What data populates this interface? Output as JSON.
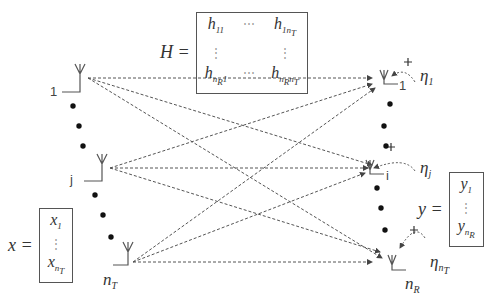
{
  "diagram": {
    "type": "MIMO channel model",
    "channel_matrix": {
      "lhs": "H =",
      "rows": [
        [
          "h11",
          "⋯",
          "h1nT"
        ],
        [
          "⋮",
          "",
          "⋮"
        ],
        [
          "hnR1",
          "⋯",
          "hnRnT"
        ]
      ]
    },
    "input_vector": {
      "lhs": "x =",
      "entries": [
        "x1",
        "⋮",
        "xnT"
      ]
    },
    "output_vector": {
      "lhs": "y =",
      "entries": [
        "y1",
        "⋮",
        "ynR"
      ]
    },
    "transmit_antennas": [
      {
        "label": "1"
      },
      {
        "label": "j"
      },
      {
        "label": "nT"
      }
    ],
    "receive_antennas": [
      {
        "label": "1",
        "noise": "η1"
      },
      {
        "label": "i",
        "noise": "ηj"
      },
      {
        "label": "nR",
        "noise": "ηnT"
      }
    ],
    "noise_plus": "+",
    "colors": {
      "line": "#555555",
      "text": "#333333",
      "background": "#ffffff"
    }
  }
}
